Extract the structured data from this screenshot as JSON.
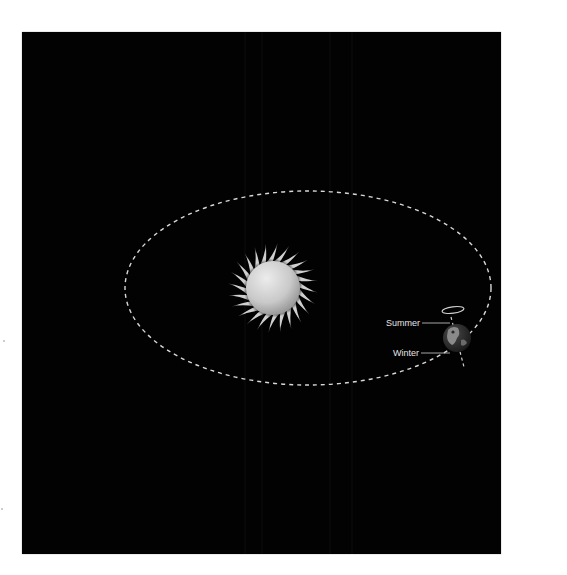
{
  "diagram": {
    "background_color": "#020202",
    "orbit": {
      "style": "dashed",
      "color": "#d8d8d8",
      "cx": 308,
      "cy": 288,
      "rx": 183,
      "ry": 97
    },
    "sun": {
      "cx": 273,
      "cy": 288,
      "disc_radius": 27,
      "corona_radius": 40,
      "color_light": "#e4e4e4",
      "color_dark": "#9a9a9a"
    },
    "earth": {
      "cx": 457,
      "cy": 338,
      "radius": 14
    },
    "labels": {
      "summer": "Summer",
      "winter": "Winter"
    }
  }
}
